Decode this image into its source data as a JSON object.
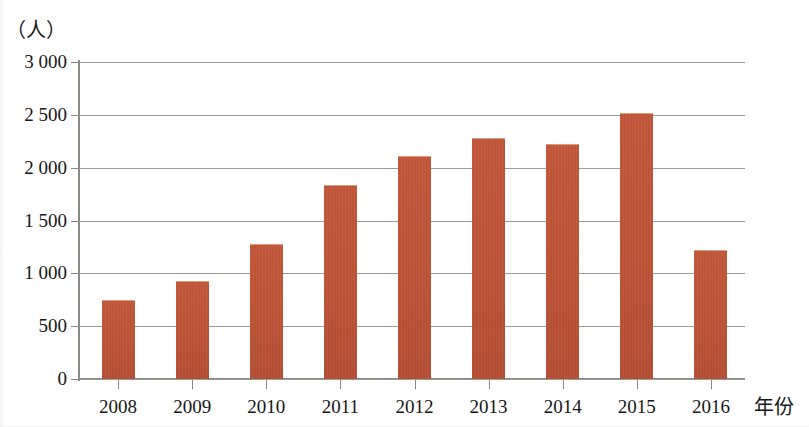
{
  "chart_data": {
    "type": "bar",
    "title": "",
    "xlabel": "年份",
    "ylabel": "（人）",
    "categories": [
      "2008",
      "2009",
      "2010",
      "2011",
      "2012",
      "2013",
      "2014",
      "2015",
      "2016"
    ],
    "values": [
      750,
      930,
      1280,
      1840,
      2110,
      2280,
      2220,
      2520,
      1220
    ],
    "ylim": [
      0,
      3000
    ],
    "ytick_labels": [
      "0",
      "500",
      "1 000",
      "1 500",
      "2 000",
      "2 500",
      "3 000"
    ],
    "ytick_values": [
      0,
      500,
      1000,
      1500,
      2000,
      2500,
      3000
    ],
    "grid": true,
    "legend": null,
    "bar_color": "#bd5337",
    "grid_color": "#9a9a93",
    "axis_color": "#8a8a85"
  }
}
